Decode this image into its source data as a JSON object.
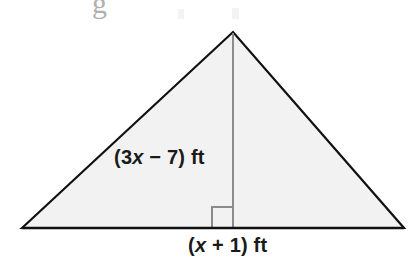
{
  "figure": {
    "kind": "triangle-with-altitude",
    "background_color": "#ffffff",
    "fill_color": "#f2f2f2",
    "stroke_color": "#111111",
    "stroke_width": 2.2,
    "altitude_color": "#8c8c8c",
    "altitude_width": 2,
    "right_angle_marker_color": "#8c8c8c",
    "vertices": {
      "left_base": {
        "x": 22,
        "y": 228
      },
      "apex": {
        "x": 233,
        "y": 32
      },
      "right_base": {
        "x": 404,
        "y": 228
      }
    },
    "altitude": {
      "from": {
        "x": 233,
        "y": 32
      },
      "to": {
        "x": 233,
        "y": 228
      }
    },
    "right_angle_marker": {
      "x": 212,
      "y": 207,
      "size": 21,
      "side": "left-of-altitude"
    },
    "polygon_points": "22,228 233,32 404,228"
  },
  "labels": {
    "side": {
      "full_text": "(3x − 7) ft",
      "open_paren": "(",
      "coefficient": "3",
      "variable": "x",
      "operator": "−",
      "constant": "7",
      "close_paren": ")",
      "unit": "ft",
      "describes": "left-slant-side-length"
    },
    "base": {
      "full_text": "(x + 1) ft",
      "open_paren": "(",
      "variable": "x",
      "operator": "+",
      "constant": "1",
      "close_paren": ")",
      "unit": "ft",
      "describes": "base-length"
    }
  },
  "artifacts": {
    "cropped_descender": "g"
  }
}
